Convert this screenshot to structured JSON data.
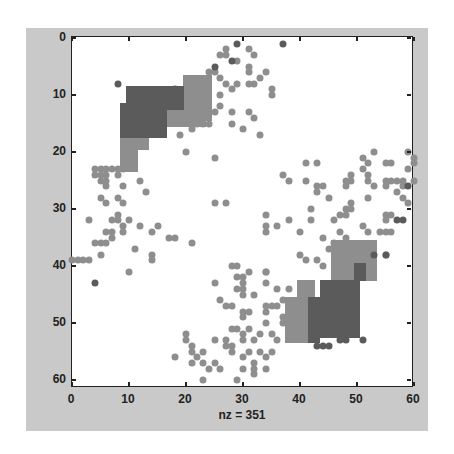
{
  "chart_data": {
    "type": "scatter",
    "title": "",
    "xlabel": "nz = 351",
    "ylabel": "",
    "xlim": [
      0,
      61
    ],
    "ylim": [
      61,
      0
    ],
    "xticks": [
      0,
      10,
      20,
      30,
      40,
      50,
      60
    ],
    "yticks": [
      0,
      10,
      20,
      30,
      40,
      50,
      60
    ],
    "grid": false,
    "nz": 351,
    "colors": {
      "dark": "#5b5b5b",
      "light": "#8e8e8e",
      "background": "#c9c9c9",
      "axes": "#ffffff"
    },
    "dense_blocks": [
      {
        "shade": "light",
        "c0": 20,
        "c1": 24,
        "r0": 7,
        "r1": 14
      },
      {
        "shade": "light",
        "c0": 16,
        "c1": 23,
        "r0": 12,
        "r1": 15
      },
      {
        "shade": "light",
        "c0": 9,
        "c1": 11,
        "r0": 17,
        "r1": 23
      },
      {
        "shade": "light",
        "c0": 12,
        "c1": 13,
        "r0": 17,
        "r1": 19
      },
      {
        "shade": "dark",
        "c0": 10,
        "c1": 16,
        "r0": 9,
        "r1": 17
      },
      {
        "shade": "dark",
        "c0": 9,
        "c1": 9,
        "r0": 12,
        "r1": 17
      },
      {
        "shade": "dark",
        "c0": 17,
        "c1": 19,
        "r0": 9,
        "r1": 12
      },
      {
        "shade": "light",
        "c0": 46,
        "c1": 53,
        "r0": 36,
        "r1": 42
      },
      {
        "shade": "light",
        "c0": 38,
        "c1": 43,
        "r0": 46,
        "r1": 53
      },
      {
        "shade": "light",
        "c0": 40,
        "c1": 42,
        "r0": 43,
        "r1": 45
      },
      {
        "shade": "dark",
        "c0": 44,
        "c1": 50,
        "r0": 43,
        "r1": 52
      },
      {
        "shade": "dark",
        "c0": 42,
        "c1": 43,
        "r0": 46,
        "r1": 53
      },
      {
        "shade": "dark",
        "c0": 50,
        "c1": 51,
        "r0": 40,
        "r1": 42
      }
    ],
    "points_dark": [
      [
        8,
        8
      ],
      [
        4,
        43
      ],
      [
        28,
        4
      ],
      [
        29,
        1
      ],
      [
        37,
        1
      ],
      [
        25,
        5
      ],
      [
        18,
        9
      ],
      [
        55,
        38
      ],
      [
        53,
        38
      ],
      [
        48,
        53
      ],
      [
        51,
        53
      ],
      [
        57,
        32
      ],
      [
        58,
        32
      ],
      [
        59,
        26
      ],
      [
        47,
        53
      ],
      [
        43,
        54
      ],
      [
        44,
        54
      ],
      [
        45,
        54
      ]
    ],
    "points_light": [
      [
        27,
        2
      ],
      [
        26,
        3
      ],
      [
        27,
        3
      ],
      [
        31,
        2
      ],
      [
        32,
        3
      ],
      [
        29,
        4
      ],
      [
        24,
        6
      ],
      [
        31,
        5
      ],
      [
        31,
        6
      ],
      [
        34,
        6
      ],
      [
        33,
        7
      ],
      [
        31,
        8
      ],
      [
        32,
        8
      ],
      [
        29,
        8
      ],
      [
        28,
        9
      ],
      [
        35,
        9
      ],
      [
        35,
        10
      ],
      [
        26,
        10
      ],
      [
        26,
        12
      ],
      [
        25,
        13
      ],
      [
        28,
        13
      ],
      [
        28,
        15
      ],
      [
        31,
        13
      ],
      [
        32,
        14
      ],
      [
        30,
        16
      ],
      [
        33,
        17
      ],
      [
        25,
        6
      ],
      [
        26,
        7
      ],
      [
        27,
        8
      ],
      [
        22,
        15
      ],
      [
        23,
        15
      ],
      [
        24,
        15
      ],
      [
        21,
        16
      ],
      [
        19,
        17
      ],
      [
        20,
        20
      ],
      [
        25,
        21
      ],
      [
        4,
        23
      ],
      [
        5,
        23
      ],
      [
        6,
        23
      ],
      [
        7,
        23
      ],
      [
        8,
        23
      ],
      [
        9,
        23
      ],
      [
        4,
        24
      ],
      [
        5,
        24
      ],
      [
        6,
        24
      ],
      [
        8,
        24
      ],
      [
        5,
        25
      ],
      [
        6,
        25
      ],
      [
        6,
        26
      ],
      [
        9,
        26
      ],
      [
        12,
        25
      ],
      [
        13,
        27
      ],
      [
        5,
        28
      ],
      [
        6,
        29
      ],
      [
        8,
        28
      ],
      [
        9,
        29
      ],
      [
        25,
        29
      ],
      [
        27,
        29
      ],
      [
        37,
        24
      ],
      [
        38,
        25
      ],
      [
        41,
        25
      ],
      [
        43,
        26
      ],
      [
        44,
        26
      ],
      [
        43,
        27
      ],
      [
        45,
        28
      ],
      [
        41,
        22
      ],
      [
        43,
        22
      ],
      [
        49,
        24
      ],
      [
        48,
        25
      ],
      [
        49,
        25
      ],
      [
        48,
        26
      ],
      [
        52,
        24
      ],
      [
        52,
        25
      ],
      [
        53,
        26
      ],
      [
        53,
        20
      ],
      [
        51,
        21
      ],
      [
        52,
        22
      ],
      [
        51,
        23
      ],
      [
        55,
        22
      ],
      [
        56,
        22
      ],
      [
        59,
        23
      ],
      [
        55,
        25
      ],
      [
        56,
        25
      ],
      [
        57,
        25
      ],
      [
        58,
        25
      ],
      [
        55,
        26
      ],
      [
        58,
        26
      ],
      [
        57,
        27
      ],
      [
        52,
        28
      ],
      [
        49,
        29
      ],
      [
        48,
        30
      ],
      [
        49,
        30
      ],
      [
        47,
        31
      ],
      [
        48,
        31
      ],
      [
        46,
        32
      ],
      [
        42,
        30
      ],
      [
        42,
        32
      ],
      [
        34,
        31
      ],
      [
        38,
        32
      ],
      [
        36,
        33
      ],
      [
        34,
        33
      ],
      [
        34,
        34
      ],
      [
        40,
        34
      ],
      [
        55,
        31
      ],
      [
        55,
        32
      ],
      [
        56,
        31
      ],
      [
        51,
        33
      ],
      [
        52,
        34
      ],
      [
        47,
        34
      ],
      [
        54,
        34
      ],
      [
        55,
        34
      ],
      [
        56,
        34
      ],
      [
        44,
        35
      ],
      [
        46,
        36
      ],
      [
        48,
        35
      ],
      [
        45,
        37
      ],
      [
        47,
        37
      ],
      [
        40,
        38
      ],
      [
        41,
        39
      ],
      [
        43,
        39
      ],
      [
        44,
        40
      ],
      [
        55,
        38
      ],
      [
        34,
        41
      ],
      [
        3,
        32
      ],
      [
        6,
        34
      ],
      [
        7,
        34
      ],
      [
        7,
        35
      ],
      [
        7,
        32
      ],
      [
        8,
        31
      ],
      [
        8,
        32
      ],
      [
        9,
        33
      ],
      [
        9,
        34
      ],
      [
        10,
        32
      ],
      [
        12,
        33
      ],
      [
        14,
        34
      ],
      [
        15,
        33
      ],
      [
        17,
        35
      ],
      [
        18,
        35
      ],
      [
        4,
        36
      ],
      [
        5,
        36
      ],
      [
        6,
        36
      ],
      [
        5,
        38
      ],
      [
        11,
        37
      ],
      [
        14,
        38
      ],
      [
        14,
        39
      ],
      [
        21,
        36
      ],
      [
        1,
        39
      ],
      [
        2,
        39
      ],
      [
        3,
        39
      ],
      [
        0,
        39
      ],
      [
        10,
        41
      ],
      [
        29,
        40
      ],
      [
        25,
        43
      ],
      [
        26,
        46
      ],
      [
        27,
        47
      ],
      [
        28,
        40
      ],
      [
        29,
        42
      ],
      [
        29,
        44
      ],
      [
        31,
        41
      ],
      [
        34,
        41
      ],
      [
        30,
        42
      ],
      [
        30,
        43
      ],
      [
        30,
        44
      ],
      [
        30,
        45
      ],
      [
        32,
        45
      ],
      [
        34,
        43
      ],
      [
        36,
        44
      ],
      [
        38,
        44
      ],
      [
        28,
        47
      ],
      [
        30,
        48
      ],
      [
        31,
        48
      ],
      [
        34,
        47
      ],
      [
        35,
        47
      ],
      [
        36,
        47
      ],
      [
        37,
        46
      ],
      [
        40,
        47
      ],
      [
        38,
        48
      ],
      [
        30,
        49
      ],
      [
        34,
        48
      ],
      [
        34,
        50
      ],
      [
        37,
        49
      ],
      [
        37,
        50
      ],
      [
        28,
        51
      ],
      [
        29,
        51
      ],
      [
        31,
        51
      ],
      [
        20,
        52
      ],
      [
        20,
        53
      ],
      [
        30,
        52
      ],
      [
        30,
        53
      ],
      [
        25,
        53
      ],
      [
        27,
        53
      ],
      [
        32,
        53
      ],
      [
        33,
        52
      ],
      [
        35,
        52
      ],
      [
        36,
        53
      ],
      [
        21,
        54
      ],
      [
        21,
        55
      ],
      [
        27,
        54
      ],
      [
        28,
        54
      ],
      [
        23,
        55
      ],
      [
        28,
        55
      ],
      [
        31,
        55
      ],
      [
        33,
        55
      ],
      [
        34,
        56
      ],
      [
        35,
        55
      ],
      [
        18,
        56
      ],
      [
        22,
        56
      ],
      [
        30,
        56
      ],
      [
        32,
        57
      ],
      [
        21,
        57
      ],
      [
        23,
        57
      ],
      [
        25,
        57
      ],
      [
        24,
        58
      ],
      [
        26,
        58
      ],
      [
        30,
        58
      ],
      [
        32,
        58
      ],
      [
        32,
        59
      ],
      [
        34,
        58
      ],
      [
        29,
        60
      ],
      [
        23,
        60
      ],
      [
        59,
        20
      ],
      [
        60,
        21
      ],
      [
        60,
        22
      ],
      [
        60,
        25
      ],
      [
        58,
        28
      ],
      [
        59,
        29
      ]
    ]
  }
}
